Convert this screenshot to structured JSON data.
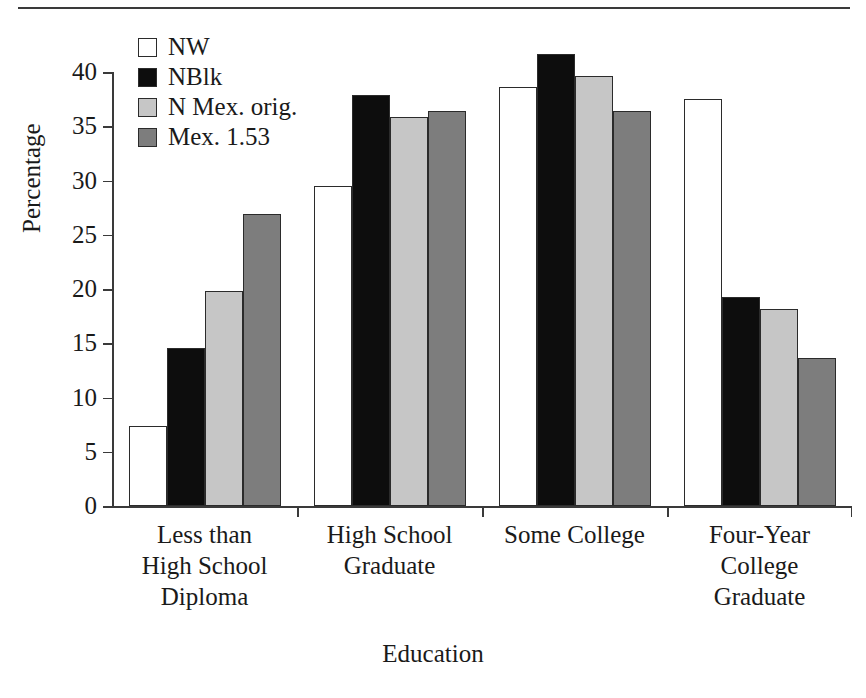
{
  "chart_data": {
    "type": "bar",
    "title": "",
    "xlabel": "Education",
    "ylabel": "Percentage",
    "ylim": [
      0,
      40
    ],
    "yticks": [
      0,
      5,
      10,
      15,
      20,
      25,
      30,
      35,
      40
    ],
    "ytick_labels": [
      "0",
      "5",
      "10",
      "15",
      "20",
      "25",
      "30",
      "35",
      "40"
    ],
    "grid": false,
    "legend_position": "top-left-inside",
    "categories": [
      "Less than\nHigh School\nDiploma",
      "High School\nGraduate",
      "Some College",
      "Four-Year\nCollege\nGraduate"
    ],
    "category_labels_flat": [
      "Less than High School Diploma",
      "High School Graduate",
      "Some College",
      "Four-Year College Graduate"
    ],
    "series": [
      {
        "name": "NW",
        "color": "#ffffff",
        "edge": "#2b2b2b",
        "values": [
          7.4,
          29.5,
          38.6,
          37.5
        ]
      },
      {
        "name": "NBlk",
        "color": "#0d0d0d",
        "edge": "#2b2b2b",
        "values": [
          14.6,
          37.9,
          41.7,
          19.3
        ]
      },
      {
        "name": "N Mex. orig.",
        "color": "#c6c6c6",
        "edge": "#2b2b2b",
        "values": [
          19.8,
          35.9,
          39.6,
          18.2
        ]
      },
      {
        "name": "Mex. 1.53",
        "color": "#7d7d7d",
        "edge": "#2b2b2b",
        "values": [
          26.9,
          36.4,
          36.4,
          13.6
        ]
      }
    ]
  },
  "legend": {
    "items": [
      {
        "label": "NW",
        "swatch": "#ffffff"
      },
      {
        "label": "NBlk",
        "swatch": "#0d0d0d"
      },
      {
        "label": "N Mex. orig.",
        "swatch": "#c6c6c6"
      },
      {
        "label": "Mex. 1.53",
        "swatch": "#7d7d7d"
      }
    ]
  },
  "axes": {
    "y_title": "Percentage",
    "x_title": "Education"
  }
}
